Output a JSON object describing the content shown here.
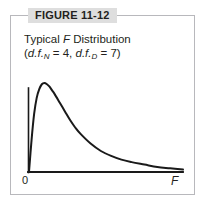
{
  "figure": {
    "tab_label": "FIGURE 11-12",
    "title_line1_prefix": "Typical ",
    "title_line1_italic": "F",
    "title_line1_suffix": " Distribution",
    "title_line2_open": "(",
    "title_line2_df1": "d.f.",
    "title_line2_sub1": "N",
    "title_line2_mid": " = 4, ",
    "title_line2_df2": "d.f.",
    "title_line2_sub2": "D",
    "title_line2_end": " = 7)"
  },
  "axes": {
    "origin_label": "0",
    "x_axis_label": "F"
  },
  "colors": {
    "border": "#b8b8bc",
    "tab_background": "#dedede",
    "ink": "#231f20",
    "curve": "#1a1a1a",
    "background": "#ffffff"
  },
  "chart_data": {
    "type": "line",
    "title": "Typical F Distribution (d.f.N = 4, d.f.D = 7)",
    "xlabel": "F",
    "ylabel": "",
    "grid": false,
    "legend": null,
    "xlim": [
      0,
      6
    ],
    "ylim": [
      0,
      0.75
    ],
    "distribution": "F",
    "df_numerator": 4,
    "df_denominator": 7,
    "x": [
      0.0,
      0.1,
      0.2,
      0.3,
      0.4,
      0.5,
      0.6,
      0.7,
      0.8,
      0.9,
      1.0,
      1.2,
      1.4,
      1.6,
      1.8,
      2.0,
      2.4,
      2.8,
      3.2,
      3.6,
      4.0,
      4.5,
      5.0,
      5.5,
      6.0
    ],
    "y": [
      0.0,
      0.26,
      0.47,
      0.6,
      0.67,
      0.71,
      0.72,
      0.71,
      0.69,
      0.66,
      0.63,
      0.56,
      0.49,
      0.42,
      0.36,
      0.31,
      0.23,
      0.17,
      0.13,
      0.1,
      0.08,
      0.06,
      0.04,
      0.03,
      0.02
    ],
    "peak_x": 0.6,
    "peak_y": 0.72
  }
}
